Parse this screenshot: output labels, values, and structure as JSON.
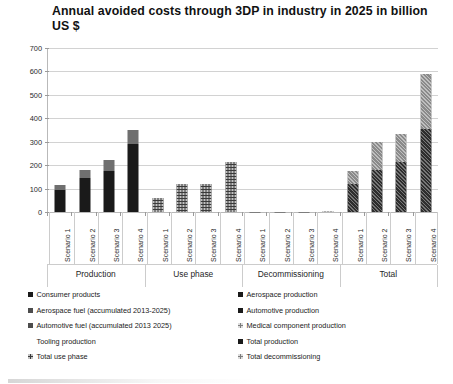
{
  "chart_data": {
    "type": "bar",
    "title": "Annual avoided costs through 3DP  in industry in 2025 in billion US $",
    "xlabel": "",
    "ylabel": "",
    "ylim": [
      0,
      700
    ],
    "yticks": [
      0,
      100,
      200,
      300,
      400,
      500,
      600,
      700
    ],
    "ytick_labels": [
      "0",
      "100",
      "200",
      "300",
      "400",
      "500",
      "600",
      "700"
    ],
    "grid": true,
    "stacked": true,
    "legend_position": "bottom",
    "categories": [
      "Scenario 1",
      "Scenario 2",
      "Scenario 3",
      "Scenario 4",
      "Scenario 1",
      "Scenario 2",
      "Scenario 3",
      "Scenario 4",
      "Scenario 1",
      "Scenario 2",
      "Scenario 3",
      "Scenario 4",
      "Scenario 1",
      "Scenario 2",
      "Scenario 3",
      "Scenario 4"
    ],
    "groups": [
      {
        "name": "Production",
        "scenarios": [
          "Scenario 1",
          "Scenario 2",
          "Scenario 3",
          "Scenario 4"
        ],
        "bars": [
          {
            "scenario": "Scenario 1",
            "segments": [
              {
                "series": "Consumer products",
                "value": 95,
                "fill": "solid-dark"
              },
              {
                "series": "Total production",
                "value": 20,
                "fill": "solid-gray"
              }
            ],
            "total": 115
          },
          {
            "scenario": "Scenario 2",
            "segments": [
              {
                "series": "Consumer products",
                "value": 145,
                "fill": "solid-dark"
              },
              {
                "series": "Total production",
                "value": 35,
                "fill": "solid-gray"
              }
            ],
            "total": 180
          },
          {
            "scenario": "Scenario 3",
            "segments": [
              {
                "series": "Consumer products",
                "value": 175,
                "fill": "solid-dark"
              },
              {
                "series": "Total production",
                "value": 45,
                "fill": "solid-gray"
              }
            ],
            "total": 220
          },
          {
            "scenario": "Scenario 4",
            "segments": [
              {
                "series": "Consumer products",
                "value": 290,
                "fill": "solid-dark"
              },
              {
                "series": "Total production",
                "value": 60,
                "fill": "solid-gray"
              }
            ],
            "total": 350
          }
        ]
      },
      {
        "name": "Use phase",
        "scenarios": [
          "Scenario 1",
          "Scenario 2",
          "Scenario 3",
          "Scenario 4"
        ],
        "bars": [
          {
            "scenario": "Scenario 1",
            "segments": [
              {
                "series": "Total use phase",
                "value": 60,
                "fill": "dot-dark"
              }
            ],
            "total": 60
          },
          {
            "scenario": "Scenario 2",
            "segments": [
              {
                "series": "Total use phase",
                "value": 120,
                "fill": "dot-dark"
              }
            ],
            "total": 120
          },
          {
            "scenario": "Scenario 3",
            "segments": [
              {
                "series": "Total use phase",
                "value": 118,
                "fill": "dot-dark"
              }
            ],
            "total": 118
          },
          {
            "scenario": "Scenario 4",
            "segments": [
              {
                "series": "Total use phase",
                "value": 215,
                "fill": "dot-dark"
              }
            ],
            "total": 215
          }
        ]
      },
      {
        "name": "Decommissioning",
        "scenarios": [
          "Scenario 1",
          "Scenario 2",
          "Scenario 3",
          "Scenario 4"
        ],
        "bars": [
          {
            "scenario": "Scenario 1",
            "segments": [
              {
                "series": "Total decommissioning",
                "value": 1,
                "fill": "dot-gray"
              }
            ],
            "total": 1
          },
          {
            "scenario": "Scenario 2",
            "segments": [
              {
                "series": "Total decommissioning",
                "value": 1,
                "fill": "dot-gray"
              }
            ],
            "total": 1
          },
          {
            "scenario": "Scenario 3",
            "segments": [
              {
                "series": "Total decommissioning",
                "value": 2,
                "fill": "dot-gray"
              }
            ],
            "total": 2
          },
          {
            "scenario": "Scenario 4",
            "segments": [
              {
                "series": "Total decommissioning",
                "value": 3,
                "fill": "dot-gray"
              }
            ],
            "total": 3
          }
        ]
      },
      {
        "name": "Total",
        "scenarios": [
          "Scenario 1",
          "Scenario 2",
          "Scenario 3",
          "Scenario 4"
        ],
        "bars": [
          {
            "scenario": "Scenario 1",
            "segments": [
              {
                "series": "Total production",
                "value": 120,
                "fill": "hatch-dark"
              },
              {
                "series": "Total use phase",
                "value": 55,
                "fill": "hatch-gray"
              }
            ],
            "total": 175
          },
          {
            "scenario": "Scenario 2",
            "segments": [
              {
                "series": "Total production",
                "value": 180,
                "fill": "hatch-dark"
              },
              {
                "series": "Total use phase",
                "value": 120,
                "fill": "hatch-gray"
              }
            ],
            "total": 300
          },
          {
            "scenario": "Scenario 3",
            "segments": [
              {
                "series": "Total production",
                "value": 215,
                "fill": "hatch-dark"
              },
              {
                "series": "Total use phase",
                "value": 120,
                "fill": "hatch-gray"
              }
            ],
            "total": 335
          },
          {
            "scenario": "Scenario 4",
            "segments": [
              {
                "series": "Total production",
                "value": 355,
                "fill": "hatch-dark"
              },
              {
                "series": "Total use phase",
                "value": 235,
                "fill": "hatch-gray"
              }
            ],
            "total": 590
          }
        ]
      }
    ],
    "legend": {
      "left_column": [
        {
          "label": "Consumer products",
          "fill": "solid-dark"
        },
        {
          "label": "Aerospace fuel (accumulated 2013-2025)",
          "fill": "solid-mid"
        },
        {
          "label": "Automotive fuel (accumulated 2013 2025)",
          "fill": "solid-mid"
        },
        {
          "label": "Tooling production",
          "fill": "none"
        },
        {
          "label": "Total use phase",
          "fill": "dot-dark"
        }
      ],
      "right_column": [
        {
          "label": "Aerospace production",
          "fill": "solid-dark"
        },
        {
          "label": "Automotive production",
          "fill": "solid-dark"
        },
        {
          "label": "Medical component production",
          "fill": "dot-gray"
        },
        {
          "label": "Total production",
          "fill": "solid-dark"
        },
        {
          "label": "Total decommissioning",
          "fill": "dot-gray"
        }
      ]
    }
  }
}
